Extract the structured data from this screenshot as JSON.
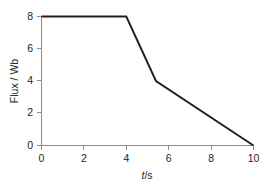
{
  "chart_data": {
    "type": "line",
    "title": "",
    "xlabel": "t/s",
    "xlabel_italic_part": "t",
    "xlabel_rest": "/s",
    "ylabel": "Flux / Wb",
    "xlim": [
      0,
      10
    ],
    "ylim": [
      0,
      8
    ],
    "grid": false,
    "legend": null,
    "x_ticks": [
      0,
      2,
      4,
      6,
      8,
      10
    ],
    "x_tick_labels": [
      "0",
      "2",
      "4",
      "6",
      "8",
      "10"
    ],
    "y_ticks": [
      0,
      2,
      4,
      6,
      8
    ],
    "y_tick_labels": [
      "0",
      "2",
      "4",
      "6",
      "8"
    ],
    "series": [
      {
        "name": "flux",
        "color": "#231f20",
        "x": [
          0,
          4,
          5.4,
          10
        ],
        "y": [
          8,
          8,
          4,
          0
        ],
        "points": [
          {
            "t": 0,
            "flux": 8
          },
          {
            "t": 4,
            "flux": 8
          },
          {
            "t": 5.4,
            "flux": 4
          },
          {
            "t": 10,
            "flux": 0
          }
        ]
      }
    ],
    "colors": {
      "data_line": "#231f20",
      "axis": "#8c8c8c",
      "text": "#231f20",
      "background": "#ffffff"
    }
  },
  "axes": {
    "y_axis_name": "Flux / Wb",
    "x_axis_name": "t/s"
  }
}
